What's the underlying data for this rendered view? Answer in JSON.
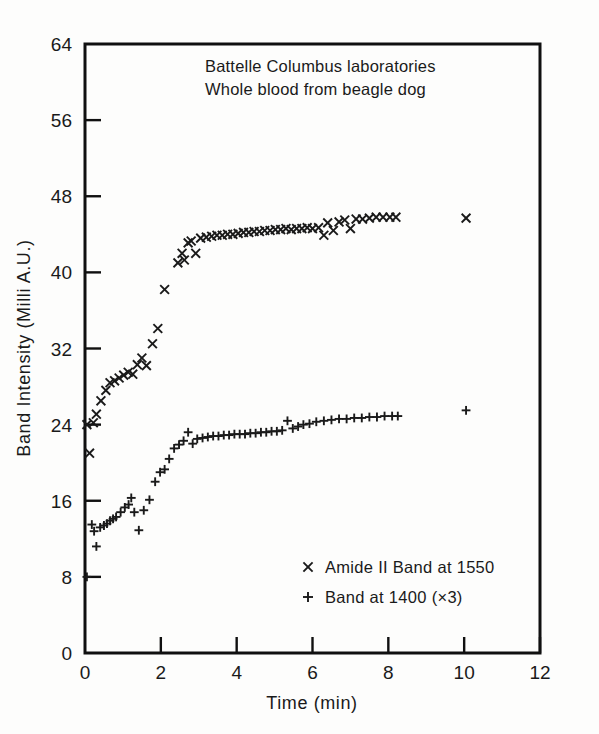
{
  "figure": {
    "annotations": [
      "Battelle Columbus laboratories",
      "Whole blood from beagle dog"
    ]
  },
  "chart_data": {
    "type": "scatter",
    "title": "",
    "annotations": [
      "Battelle Columbus laboratories",
      "Whole blood from beagle dog"
    ],
    "xlabel": "Time (min)",
    "ylabel": "Band Intensity (Milli A.U.)",
    "xlim": [
      0,
      12
    ],
    "ylim": [
      0,
      64
    ],
    "xticks": [
      0,
      2,
      4,
      6,
      8,
      10,
      12
    ],
    "yticks": [
      0,
      8,
      16,
      24,
      32,
      40,
      48,
      56,
      64
    ],
    "xtick_labels": [
      "0",
      "2",
      "4",
      "6",
      "8",
      "10",
      "12"
    ],
    "ytick_labels": [
      "0",
      "8",
      "16",
      "24",
      "32",
      "40",
      "48",
      "56",
      "64"
    ],
    "grid": false,
    "legend_position": "lower-center-right",
    "series": [
      {
        "name": "Amide II Band at 1550",
        "marker": "x",
        "points": [
          [
            0.05,
            24.0
          ],
          [
            0.12,
            21.0
          ],
          [
            0.22,
            24.2
          ],
          [
            0.3,
            25.1
          ],
          [
            0.42,
            26.5
          ],
          [
            0.55,
            27.6
          ],
          [
            0.66,
            28.4
          ],
          [
            0.78,
            28.6
          ],
          [
            0.9,
            28.9
          ],
          [
            1.02,
            29.2
          ],
          [
            1.14,
            29.5
          ],
          [
            1.26,
            29.3
          ],
          [
            1.38,
            30.3
          ],
          [
            1.5,
            31.0
          ],
          [
            1.62,
            30.2
          ],
          [
            1.78,
            32.5
          ],
          [
            1.92,
            34.1
          ],
          [
            2.1,
            38.2
          ],
          [
            2.45,
            41.0
          ],
          [
            2.56,
            42.0
          ],
          [
            2.62,
            41.3
          ],
          [
            2.72,
            43.1
          ],
          [
            2.8,
            43.3
          ],
          [
            2.92,
            42.0
          ],
          [
            3.05,
            43.6
          ],
          [
            3.2,
            43.7
          ],
          [
            3.34,
            43.8
          ],
          [
            3.48,
            43.9
          ],
          [
            3.62,
            43.9
          ],
          [
            3.76,
            44.0
          ],
          [
            3.9,
            44.0
          ],
          [
            4.04,
            44.1
          ],
          [
            4.18,
            44.2
          ],
          [
            4.32,
            44.2
          ],
          [
            4.46,
            44.3
          ],
          [
            4.6,
            44.3
          ],
          [
            4.74,
            44.4
          ],
          [
            4.88,
            44.4
          ],
          [
            5.02,
            44.5
          ],
          [
            5.16,
            44.5
          ],
          [
            5.3,
            44.6
          ],
          [
            5.44,
            44.5
          ],
          [
            5.58,
            44.6
          ],
          [
            5.72,
            44.6
          ],
          [
            5.86,
            44.7
          ],
          [
            6.0,
            44.6
          ],
          [
            6.16,
            44.7
          ],
          [
            6.3,
            43.9
          ],
          [
            6.4,
            45.2
          ],
          [
            6.55,
            44.4
          ],
          [
            6.7,
            45.3
          ],
          [
            6.85,
            45.5
          ],
          [
            7.0,
            44.6
          ],
          [
            7.15,
            45.6
          ],
          [
            7.32,
            45.6
          ],
          [
            7.5,
            45.7
          ],
          [
            7.68,
            45.8
          ],
          [
            7.86,
            45.8
          ],
          [
            8.04,
            45.8
          ],
          [
            8.2,
            45.8
          ],
          [
            10.05,
            45.7
          ]
        ]
      },
      {
        "name": "Band at 1400 (×3)",
        "marker": "+",
        "points": [
          [
            0.05,
            8.0
          ],
          [
            0.18,
            13.5
          ],
          [
            0.24,
            12.8
          ],
          [
            0.3,
            11.2
          ],
          [
            0.4,
            13.2
          ],
          [
            0.5,
            13.4
          ],
          [
            0.58,
            13.6
          ],
          [
            0.66,
            13.9
          ],
          [
            0.74,
            14.1
          ],
          [
            0.82,
            14.3
          ],
          [
            0.94,
            14.8
          ],
          [
            1.05,
            15.3
          ],
          [
            1.15,
            15.6
          ],
          [
            1.22,
            16.3
          ],
          [
            1.3,
            14.8
          ],
          [
            1.42,
            12.9
          ],
          [
            1.55,
            15.0
          ],
          [
            1.7,
            16.1
          ],
          [
            1.85,
            18.0
          ],
          [
            1.98,
            19.0
          ],
          [
            2.1,
            19.3
          ],
          [
            2.22,
            20.4
          ],
          [
            2.35,
            21.5
          ],
          [
            2.48,
            21.9
          ],
          [
            2.6,
            22.3
          ],
          [
            2.72,
            23.2
          ],
          [
            2.84,
            22.0
          ],
          [
            2.96,
            22.5
          ],
          [
            3.1,
            22.6
          ],
          [
            3.24,
            22.7
          ],
          [
            3.38,
            22.8
          ],
          [
            3.52,
            22.8
          ],
          [
            3.66,
            22.9
          ],
          [
            3.8,
            22.9
          ],
          [
            3.94,
            23.0
          ],
          [
            4.08,
            23.0
          ],
          [
            4.22,
            23.0
          ],
          [
            4.36,
            23.1
          ],
          [
            4.5,
            23.1
          ],
          [
            4.64,
            23.2
          ],
          [
            4.78,
            23.2
          ],
          [
            4.92,
            23.3
          ],
          [
            5.06,
            23.3
          ],
          [
            5.2,
            23.4
          ],
          [
            5.34,
            24.4
          ],
          [
            5.48,
            23.6
          ],
          [
            5.62,
            23.8
          ],
          [
            5.76,
            24.0
          ],
          [
            5.92,
            24.1
          ],
          [
            6.1,
            24.3
          ],
          [
            6.3,
            24.4
          ],
          [
            6.5,
            24.5
          ],
          [
            6.7,
            24.6
          ],
          [
            6.9,
            24.6
          ],
          [
            7.1,
            24.7
          ],
          [
            7.3,
            24.7
          ],
          [
            7.5,
            24.8
          ],
          [
            7.7,
            24.8
          ],
          [
            7.9,
            24.9
          ],
          [
            8.1,
            24.9
          ],
          [
            8.25,
            24.9
          ],
          [
            10.05,
            25.5
          ]
        ]
      }
    ],
    "legend": [
      {
        "marker": "x",
        "label": "Amide II Band at 1550"
      },
      {
        "marker": "+",
        "label": "Band at 1400 (×3)"
      }
    ]
  }
}
